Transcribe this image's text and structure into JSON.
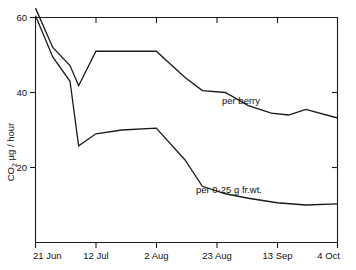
{
  "chart_data": {
    "type": "line",
    "title": "",
    "xlabel": "",
    "ylabel": "CO2 µg / hour",
    "ylabel_parts": {
      "prefix": "CO",
      "sub": "2",
      "suffix": " µg / hour"
    },
    "grid": false,
    "legend_position": "inline-annotations",
    "xlim": [
      0,
      105
    ],
    "ylim": [
      0,
      62
    ],
    "yticks": [
      20,
      40,
      60
    ],
    "ytick_labels": [
      "20",
      "40",
      "60"
    ],
    "xticks": [
      0,
      21,
      42,
      63,
      84,
      105
    ],
    "xtick_labels": [
      "21 Jun",
      "12 Jul",
      "2 Aug",
      "23 Aug",
      "13 Sep",
      "4 Oct"
    ],
    "series": [
      {
        "name": "per berry",
        "label": "per berry",
        "x": [
          0,
          6,
          12,
          15,
          21,
          30,
          42,
          52,
          58,
          66,
          74,
          82,
          88,
          94,
          105
        ],
        "values": [
          62.5,
          52.0,
          47.2,
          41.8,
          51.0,
          51.0,
          51.0,
          44.0,
          40.5,
          40.0,
          36.5,
          34.5,
          34.0,
          35.5,
          33.2
        ]
      },
      {
        "name": "per 0·25 g fr.wt.",
        "label": "per 0·25 g fr.wt.",
        "x": [
          0,
          6,
          12,
          15,
          21,
          30,
          42,
          52,
          58,
          66,
          74,
          84,
          94,
          105
        ],
        "values": [
          60.5,
          49.5,
          43.0,
          25.8,
          29.0,
          30.0,
          30.5,
          22.0,
          15.0,
          13.0,
          11.8,
          10.6,
          10.0,
          10.3
        ]
      }
    ],
    "annotations": [
      {
        "text": "per berry",
        "x": 66,
        "y": 40.5
      },
      {
        "text": "per 0·25 g fr.wt.",
        "x": 52,
        "y": 15.0
      }
    ]
  },
  "colors": {
    "line": "#1a1a1a",
    "axis": "#1a1a1a",
    "background": "#ffffff"
  }
}
